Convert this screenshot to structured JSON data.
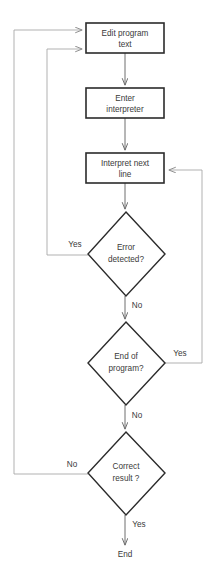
{
  "diagram": {
    "type": "flowchart",
    "colors": {
      "background": "#ffffff",
      "box_stroke": "#2b2b2b",
      "diamond_stroke": "#2b2b2b",
      "flow_line": "#6e6e6e",
      "feedback_line": "#a8a8a8",
      "text": "#3a3a3a"
    },
    "nodes": [
      {
        "id": "edit",
        "shape": "process",
        "line1": "Edit program",
        "line2": "text"
      },
      {
        "id": "enter",
        "shape": "process",
        "line1": "Enter",
        "line2": "interpreter"
      },
      {
        "id": "interpret",
        "shape": "process",
        "line1": "Interpret next",
        "line2": "line"
      },
      {
        "id": "error",
        "shape": "decision",
        "line1": "Error",
        "line2": "detected?"
      },
      {
        "id": "endprog",
        "shape": "decision",
        "line1": "End of",
        "line2": "program?"
      },
      {
        "id": "correct",
        "shape": "decision",
        "line1": "Correct",
        "line2": "result ?"
      },
      {
        "id": "end",
        "shape": "terminator",
        "line1": "End"
      }
    ],
    "edge_labels": {
      "error_yes": "Yes",
      "error_no": "No",
      "endprog_yes": "Yes",
      "endprog_no": "No",
      "correct_no": "No",
      "correct_yes": "Yes"
    }
  }
}
